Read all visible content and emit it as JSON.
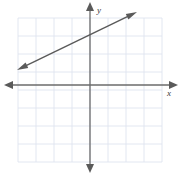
{
  "figure": {
    "width": 182,
    "height": 175,
    "background_color": "#ffffff"
  },
  "axes": {
    "x_axis_label": "x",
    "y_axis_label": "y",
    "axis_color": "#6b6b6b",
    "origin_px": {
      "x": 90,
      "y": 85
    },
    "unit_px": 18,
    "x_arrow_left": true,
    "x_arrow_right": true,
    "y_arrow_up": true,
    "y_arrow_down": true
  },
  "grid": {
    "color": "#dfe4ef",
    "left_px": 18,
    "top_px": 18,
    "right_px": 162,
    "bottom_px": 162,
    "columns": 8,
    "rows": 8,
    "cell_px": 18,
    "visible": true
  },
  "chart_data": {
    "type": "line",
    "xlabel": "x",
    "ylabel": "y",
    "xlim": [
      -4,
      4
    ],
    "ylim": [
      -4,
      4
    ],
    "xticks": [
      -4,
      -3,
      -2,
      -1,
      0,
      1,
      2,
      3,
      4
    ],
    "yticks": [
      -4,
      -3,
      -2,
      -1,
      0,
      1,
      2,
      3,
      4
    ],
    "grid": true,
    "legend": "none",
    "series": [
      {
        "name": "line",
        "kind": "line",
        "slope": 0.5,
        "intercept": 2.4,
        "equation": "y = 0.5x + 2.4",
        "color": "#5a5a5a",
        "arrows": "both",
        "x": [
          -4.05,
          2.6
        ],
        "values": [
          0.83,
          4.05
        ],
        "endpoint_px": [
          {
            "x": 17,
            "y": 70
          },
          {
            "x": 137,
            "y": 12
          }
        ]
      }
    ]
  }
}
